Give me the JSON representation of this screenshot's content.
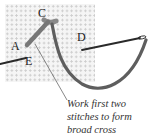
{
  "diagram": {
    "labels": {
      "a": "A",
      "c": "C",
      "d": "D",
      "e": "E"
    },
    "caption_lines": [
      "Work first two",
      "stitches to form",
      "broad cross"
    ],
    "colors": {
      "thread": "#5e5e5e",
      "needle": "#2a2a2a",
      "fabric_dots": "#c8c8c8",
      "leader_line": "#555555"
    }
  }
}
